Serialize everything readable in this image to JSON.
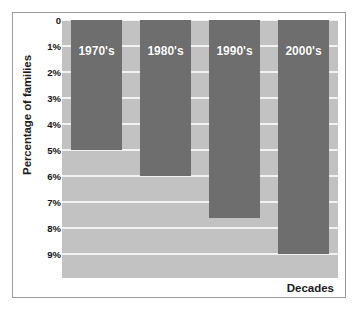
{
  "chart_data": {
    "type": "bar",
    "title": "",
    "xlabel": "Decades",
    "ylabel": "Percentage of families",
    "categories": [
      "1970's",
      "1980's",
      "1990's",
      "2000's"
    ],
    "values": [
      5.0,
      6.0,
      7.6,
      9.0
    ],
    "ylim": [
      0,
      9
    ],
    "y_axis_inverted": true,
    "yticks": [
      0,
      1,
      2,
      3,
      4,
      5,
      6,
      7,
      8,
      9
    ],
    "ytick_labels": [
      "0",
      "1%",
      "2%",
      "3%",
      "4%",
      "5%",
      "6%",
      "7%",
      "8%",
      "9%"
    ],
    "grid": true,
    "legend": "none",
    "bars_grow_downward": true,
    "bar_labels_inside_top": true,
    "colors": {
      "bar": "#6e6e6e",
      "plot_background": "#c2c2c2",
      "gridline": "#f2f2f2",
      "figure_background": "#ffffff",
      "frame_border": "#9a9a9a",
      "bar_label_text": "#ffffff",
      "axis_text": "#141414"
    }
  }
}
